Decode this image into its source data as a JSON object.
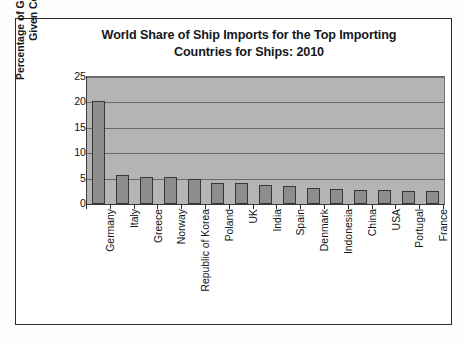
{
  "figure": {
    "title_lines": [
      "World Share of Ship Imports for the Top Importing",
      "Countries for Ships: 2010"
    ],
    "y_axis_title_lines": [
      "Percentage of Global Ship Imports of a",
      "Given Country"
    ]
  },
  "colors": {
    "plot_background": "#b4b4b4",
    "bar_fill": "#8d8d8d",
    "bar_border": "#37373a",
    "gridline": "#6a6a6a",
    "frame": "#2b2b2b",
    "text": "#111316"
  },
  "chart_data": {
    "type": "bar",
    "title": "World Share of Ship Imports for the Top Importing Countries for Ships: 2010",
    "xlabel": "",
    "ylabel": "Percentage of Global Ship Imports of a Given Country",
    "ylim": [
      0,
      25
    ],
    "yticks": [
      0,
      5,
      10,
      15,
      20,
      25
    ],
    "ytick_labels": [
      "0",
      "5",
      "10",
      "15",
      "20",
      "25"
    ],
    "grid": true,
    "grid_axis": "y",
    "legend": false,
    "categories": [
      "Germany",
      "Italy",
      "Greece",
      "Norway",
      "Republic of Korea",
      "Poland",
      "UK",
      "India",
      "Spain",
      "Denmark",
      "Indonesia",
      "China",
      "USA",
      "Portugal",
      "France"
    ],
    "values": [
      20.3,
      5.7,
      5.4,
      5.3,
      4.9,
      4.2,
      4.1,
      3.7,
      3.6,
      3.2,
      2.9,
      2.7,
      2.8,
      2.6,
      2.5
    ]
  }
}
